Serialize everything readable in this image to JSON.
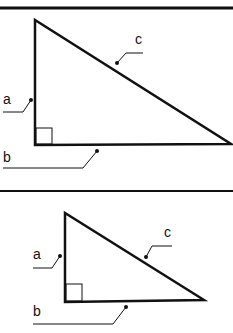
{
  "diagram": {
    "stroke_color": "#111111",
    "panels": [
      {
        "separator_y": 8,
        "vertices": {
          "apex": [
            35,
            20
          ],
          "right_angle": [
            35,
            145
          ],
          "far": [
            231,
            144
          ]
        },
        "labels": {
          "a": "a",
          "b": "b",
          "c": "c"
        }
      },
      {
        "separator_y": 191,
        "vertices": {
          "apex": [
            65,
            213
          ],
          "right_angle": [
            65,
            302
          ],
          "far": [
            204,
            300
          ]
        },
        "labels": {
          "a": "a",
          "b": "b",
          "c": "c"
        }
      }
    ]
  }
}
